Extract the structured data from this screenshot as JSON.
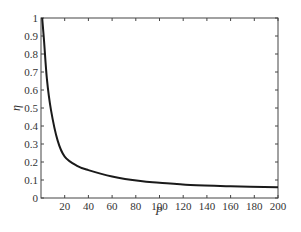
{
  "chart_data": {
    "type": "line",
    "title": "",
    "xlabel": "P",
    "ylabel": "η",
    "xlim": [
      0,
      200
    ],
    "ylim": [
      0,
      1
    ],
    "grid": false,
    "legend": null,
    "x_ticks": [
      20,
      40,
      60,
      80,
      100,
      120,
      140,
      160,
      180,
      200
    ],
    "x_tick_labels": [
      "20",
      "40",
      "60",
      "80",
      "100",
      "120",
      "140",
      "160",
      "180",
      "200"
    ],
    "y_ticks": [
      0,
      0.1,
      0.2,
      0.3,
      0.4,
      0.5,
      0.6,
      0.7,
      0.8,
      0.9,
      1
    ],
    "y_tick_labels": [
      "0",
      "0.1",
      "0.2",
      "0.3",
      "0.4",
      "0.5",
      "0.6",
      "0.7",
      "0.8",
      "0.9",
      "1"
    ],
    "series": [
      {
        "name": "η",
        "color": "#1a1a1a",
        "x": [
          1,
          2.5,
          5,
          8.4,
          14,
          20,
          30,
          40,
          60,
          84,
          100,
          126,
          160,
          200
        ],
        "y": [
          1.0,
          0.88,
          0.66,
          0.49,
          0.32,
          0.23,
          0.18,
          0.155,
          0.12,
          0.094,
          0.085,
          0.072,
          0.065,
          0.06
        ]
      }
    ]
  }
}
